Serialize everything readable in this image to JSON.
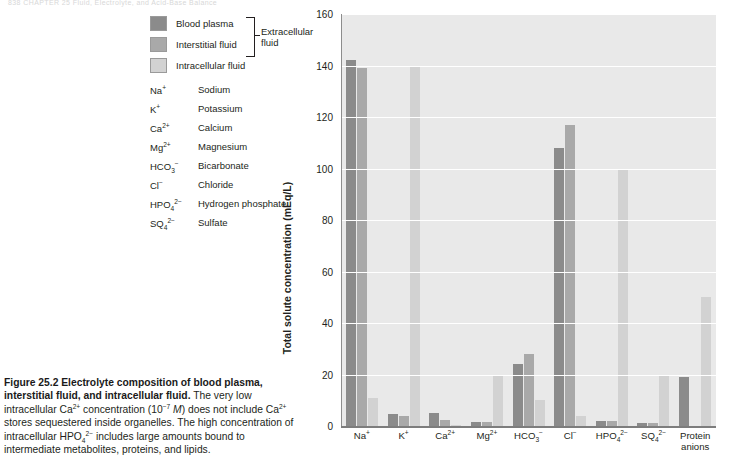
{
  "runhead": "838    CHAPTER 25  Fluid, Electrolyte, and Acid-Base Balance",
  "legend": {
    "items": [
      {
        "label": "Blood plasma",
        "color": "#8b8b8b"
      },
      {
        "label": "Interstitial fluid",
        "color": "#a9a9a9"
      },
      {
        "label": "Intracellular fluid",
        "color": "#d2d2d2"
      }
    ],
    "brace_label_line1": "Extracellular",
    "brace_label_line2": "fluid"
  },
  "glossary": [
    {
      "symbol_base": "Na",
      "symbol_sup": "+",
      "symbol_sub": "",
      "name": "Sodium"
    },
    {
      "symbol_base": "K",
      "symbol_sup": "+",
      "symbol_sub": "",
      "name": "Potassium"
    },
    {
      "symbol_base": "Ca",
      "symbol_sup": "2+",
      "symbol_sub": "",
      "name": "Calcium"
    },
    {
      "symbol_base": "Mg",
      "symbol_sup": "2+",
      "symbol_sub": "",
      "name": "Magnesium"
    },
    {
      "symbol_base": "HCO",
      "symbol_sup": "−",
      "symbol_sub": "3",
      "name": "Bicarbonate"
    },
    {
      "symbol_base": "Cl",
      "symbol_sup": "−",
      "symbol_sub": "",
      "name": "Chloride"
    },
    {
      "symbol_base": "HPO",
      "symbol_sup": "2−",
      "symbol_sub": "4",
      "name": "Hydrogen phosphate"
    },
    {
      "symbol_base": "SQ",
      "symbol_sup": "2−",
      "symbol_sub": "4",
      "name": "Sulfate"
    }
  ],
  "caption": {
    "figure_number": "Figure 25.2",
    "title": "Electrolyte composition of blood plasma, interstitial fluid, and intracellular fluid.",
    "body_1": "The very low intracellular Ca",
    "body_1_sup": "2+",
    "body_2": " concentration (10",
    "body_2_sup": "−7",
    "body_3": " ",
    "body_3_italic": "M",
    "body_4": ") does not include Ca",
    "body_4_sup": "2+",
    "body_5": " stores sequestered inside organelles. The high concentration of intracellular HPO",
    "body_5_sub": "4",
    "body_5_sup": "2−",
    "body_6": " includes large amounts bound to intermediate metabolites, proteins, and lipids."
  },
  "chart_data": {
    "type": "bar",
    "title": "",
    "xlabel": "",
    "ylabel": "Total solute concentration (mEq/L)",
    "ylim": [
      0,
      160
    ],
    "yticks": [
      0,
      20,
      40,
      60,
      80,
      100,
      120,
      140,
      160
    ],
    "grid": true,
    "legend_position": "top-left-outside",
    "categories": [
      {
        "base": "Na",
        "sup": "+",
        "sub": "",
        "line2": ""
      },
      {
        "base": "K",
        "sup": "+",
        "sub": "",
        "line2": ""
      },
      {
        "base": "Ca",
        "sup": "2+",
        "sub": "",
        "line2": ""
      },
      {
        "base": "Mg",
        "sup": "2+",
        "sub": "",
        "line2": ""
      },
      {
        "base": "HCO",
        "sup": "−",
        "sub": "3",
        "line2": ""
      },
      {
        "base": "Cl",
        "sup": "−",
        "sub": "",
        "line2": ""
      },
      {
        "base": "HPO",
        "sup": "2−",
        "sub": "4",
        "line2": ""
      },
      {
        "base": "SQ",
        "sup": "2−",
        "sub": "4",
        "line2": ""
      },
      {
        "base": "Protein",
        "sup": "",
        "sub": "",
        "line2": "anions"
      }
    ],
    "series": [
      {
        "name": "Blood plasma",
        "color": "#8b8b8b",
        "values": [
          142,
          4.5,
          5.0,
          1.5,
          24,
          108,
          2.0,
          1.0,
          19
        ]
      },
      {
        "name": "Interstitial fluid",
        "color": "#a9a9a9",
        "values": [
          139,
          4.0,
          2.5,
          1.5,
          28,
          117,
          2.0,
          1.0,
          0
        ]
      },
      {
        "name": "Intracellular fluid",
        "color": "#d2d2d2",
        "values": [
          11,
          140,
          0.5,
          20,
          10,
          4.0,
          100,
          19.5,
          50
        ]
      }
    ]
  }
}
